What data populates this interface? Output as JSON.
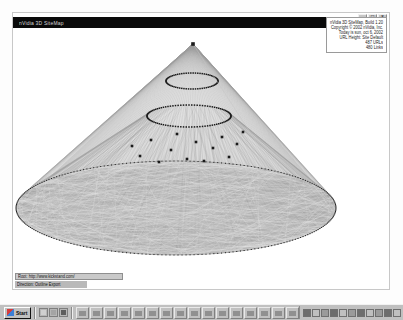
{
  "window": {
    "title": "nVidia 3D SiteMap",
    "controls": [
      {
        "name": "minimize-button",
        "glyph": "_"
      },
      {
        "name": "maximize-button",
        "glyph": "□"
      },
      {
        "name": "close-button",
        "glyph": "×"
      }
    ]
  },
  "info_panel": {
    "lines": [
      "nVidia 3D SiteMap, Build 1.20",
      "Copyright © 2002 nVidia, Inc.",
      "Today is sun, oct 6, 2002",
      "URL Height: Site Default",
      "487 URLs",
      "480 Links"
    ]
  },
  "status_bar": {
    "line1": "Root: http://www.kickstand.com/",
    "line2": "Direction: Outline Export"
  },
  "visualization": {
    "type": "3d-sitemap-cone",
    "root_node_label": "root",
    "ring_count": 3,
    "node_color": "#1b1b1b",
    "link_color": "#9a9a9a",
    "background": "#ffffff",
    "apex_x": 192,
    "apex_y": 43,
    "rings": [
      {
        "cx": 191,
        "cy": 80,
        "rx": 26,
        "ry": 8,
        "label": "level-1-ring"
      },
      {
        "cx": 188,
        "cy": 115,
        "rx": 42,
        "ry": 11,
        "label": "level-2-ring"
      },
      {
        "cx": 175,
        "cy": 207,
        "rx": 160,
        "ry": 47,
        "label": "level-3-ring"
      }
    ],
    "scatter_nodes": 14
  },
  "taskbar": {
    "start_label": "Start",
    "clock": "10:23",
    "quick_launch_count": 3,
    "task_button_count": 16,
    "tray_icon_count": 11
  }
}
